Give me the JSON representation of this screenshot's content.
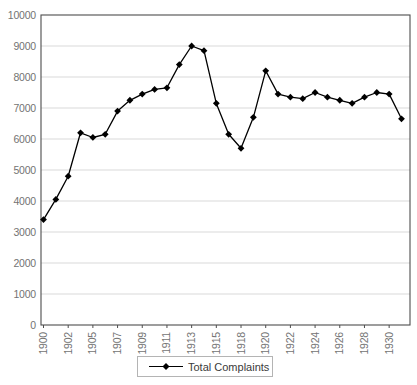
{
  "chart_data": {
    "type": "line",
    "title": "",
    "series": [
      {
        "name": "Total Complaints",
        "marker": "diamond",
        "color": "#000000",
        "values": [
          3400,
          4050,
          4800,
          6200,
          6050,
          6150,
          6900,
          7250,
          7450,
          7600,
          7650,
          8400,
          9000,
          8850,
          7150,
          6150,
          5700,
          6700,
          8200,
          7450,
          7350,
          7300,
          7500,
          7350,
          7250,
          7150,
          7350,
          7500,
          7450,
          6650
        ]
      }
    ],
    "x_tick_labels": [
      "1900",
      "1902",
      "1905",
      "1907",
      "1909",
      "1911",
      "1913",
      "1915",
      "1918",
      "1920",
      "1922",
      "1924",
      "1926",
      "1928",
      "1930"
    ],
    "x_label_every_n_points": 2,
    "x_tick_rotation_degrees": -90,
    "y_ticks": [
      0,
      1000,
      2000,
      3000,
      4000,
      5000,
      6000,
      7000,
      8000,
      9000,
      10000
    ],
    "ylim": [
      0,
      10000
    ],
    "grid": "horizontal",
    "legend_position": "bottom-center",
    "colors": {
      "line": "#000000",
      "marker": "#000000",
      "grid": "#d9d9d9",
      "plot_border": "#4d4d4d",
      "tick_text": "#737373",
      "legend_border": "#b4b4b4",
      "background": "#ffffff"
    }
  }
}
